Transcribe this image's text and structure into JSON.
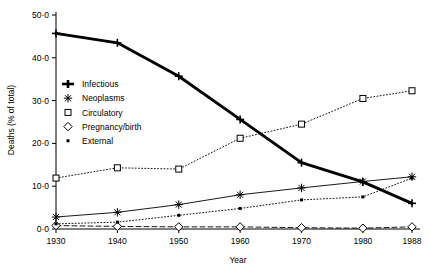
{
  "header_fragment": "",
  "chart_data": {
    "type": "line",
    "title": "",
    "xlabel": "Year",
    "ylabel": "Deaths (% of total)",
    "x": [
      1930,
      1940,
      1950,
      1960,
      1970,
      1980,
      1988
    ],
    "xtick_labels": [
      "1930",
      "1940",
      "1950",
      "1960",
      "1970",
      "1980",
      "1988"
    ],
    "ytick_labels": [
      "0·0",
      "10·0",
      "20·0",
      "30·0",
      "40·0",
      "50·0"
    ],
    "ytick_values": [
      0,
      10,
      20,
      30,
      40,
      50
    ],
    "ylim": [
      0,
      50
    ],
    "xlim": [
      1930,
      1988
    ],
    "grid": false,
    "legend_position": "left-middle",
    "series": [
      {
        "name": "Infectious",
        "marker": "plus",
        "line": "thick-solid",
        "color": "#000000",
        "values": [
          45.7,
          43.5,
          35.7,
          25.6,
          15.5,
          11.0,
          6.0
        ]
      },
      {
        "name": "Neoplasms",
        "marker": "asterisk",
        "line": "thin-solid",
        "color": "#000000",
        "values": [
          2.8,
          3.9,
          5.7,
          8.0,
          9.6,
          11.1,
          12.2
        ]
      },
      {
        "name": "Circulatory",
        "marker": "square",
        "line": "dotted",
        "color": "#000000",
        "values": [
          11.9,
          14.3,
          14.0,
          21.2,
          24.5,
          30.5,
          32.3
        ]
      },
      {
        "name": "Pregnancy/birth",
        "marker": "diamond",
        "line": "dashed",
        "color": "#000000",
        "values": [
          0.8,
          0.6,
          0.5,
          0.5,
          0.3,
          0.2,
          0.5
        ]
      },
      {
        "name": "External",
        "marker": "dot",
        "line": "dotted",
        "color": "#000000",
        "values": [
          1.2,
          1.6,
          3.2,
          4.8,
          6.8,
          7.5,
          11.9
        ]
      }
    ]
  }
}
